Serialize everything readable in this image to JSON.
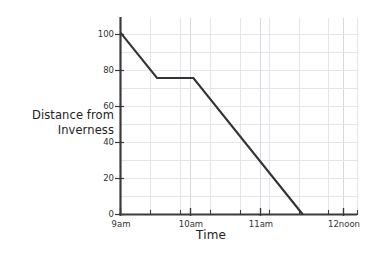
{
  "chart_data": {
    "type": "line",
    "title": "",
    "subtitle": "",
    "xlabel": "Time",
    "ylabel": "Distance from Inverness",
    "ylabel_lines": [
      "Distance from",
      "Inverness"
    ],
    "x_tick_labels": [
      "9am",
      "10am",
      "11am",
      "12noon"
    ],
    "x_tick_values": [
      9,
      10,
      11,
      12
    ],
    "y_tick_labels": [
      "0",
      "20",
      "40",
      "60",
      "80",
      "100"
    ],
    "y_tick_values": [
      0,
      20,
      40,
      60,
      80,
      100
    ],
    "xlim": [
      9,
      12.25
    ],
    "ylim": [
      0,
      108
    ],
    "x_minor_step": 0.25,
    "y_major_step": 20,
    "grid": true,
    "grid_color": "#e2e2ea",
    "legend": "none",
    "line_color": "#333333",
    "axis_color": "#3a3a3a",
    "series": [
      {
        "name": "Distance from Inverness",
        "points": [
          {
            "x": 9.0,
            "y": 100,
            "x_label": "9am"
          },
          {
            "x": 9.5,
            "y": 75,
            "x_label": "9:30am"
          },
          {
            "x": 10.0,
            "y": 75,
            "x_label": "10am"
          },
          {
            "x": 11.5,
            "y": 0,
            "x_label": "11:30am"
          }
        ]
      }
    ],
    "annotations": []
  }
}
